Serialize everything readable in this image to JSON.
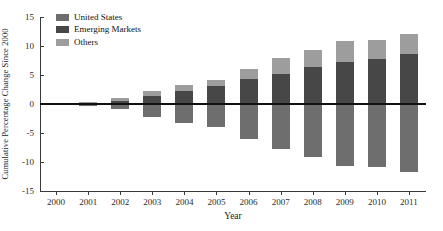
{
  "chart_data": {
    "type": "bar",
    "subtype": "stacked-bar-diverging",
    "title": "Cumulative Percentage Change Since 2000",
    "xlabel": "Year",
    "ylabel": "Cumulative Percentage Change Since 2000",
    "categories": [
      "2000",
      "2001",
      "2002",
      "2003",
      "2004",
      "2005",
      "2006",
      "2007",
      "2008",
      "2009",
      "2010",
      "2011"
    ],
    "ylim": [
      -15,
      15
    ],
    "yticks": [
      15,
      10,
      5,
      0,
      -5,
      -10,
      -15
    ],
    "ytick_labels": [
      "15",
      "10",
      "5",
      "0",
      "-5",
      "-10",
      "-15"
    ],
    "grid": false,
    "legend_position": "top-left",
    "zero_reference_line": true,
    "series": [
      {
        "name": "United States",
        "color": "#6e6e6e",
        "values": [
          0,
          -0.3,
          -0.8,
          -2.2,
          -3.2,
          -4.0,
          -6.0,
          -7.8,
          -9.1,
          -10.7,
          -10.9,
          -11.8
        ]
      },
      {
        "name": "Emerging Markets",
        "color": "#474747",
        "values": [
          0,
          0.3,
          0.6,
          1.3,
          2.2,
          3.1,
          4.3,
          5.2,
          6.4,
          7.2,
          7.7,
          8.6
        ]
      },
      {
        "name": "Others",
        "color": "#9d9d9d",
        "values": [
          0,
          0.1,
          0.35,
          1.0,
          1.1,
          1.1,
          1.8,
          2.8,
          2.9,
          3.6,
          3.4,
          3.5
        ]
      }
    ],
    "stacked_positive_totals": [
      0,
      0.4,
      0.95,
      2.3,
      3.3,
      4.2,
      6.1,
      8.0,
      9.3,
      10.8,
      11.1,
      12.1
    ]
  },
  "legend": {
    "items": [
      {
        "label": "United States",
        "color": "#6e6e6e"
      },
      {
        "label": "Emerging Markets",
        "color": "#474747"
      },
      {
        "label": "Others",
        "color": "#9d9d9d"
      }
    ]
  }
}
